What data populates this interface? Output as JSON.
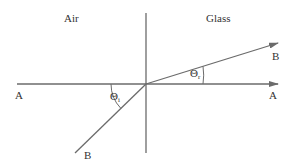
{
  "diagram": {
    "type": "refraction",
    "regions": {
      "left": "Air",
      "right": "Glass"
    },
    "points": {
      "A_left": "A",
      "A_right": "A",
      "B_incident": "B",
      "B_refracted": "B"
    },
    "angles": {
      "incident": {
        "symbol": "Θ",
        "subscript": "i"
      },
      "refracted": {
        "symbol": "Θ",
        "subscript": "r"
      }
    },
    "colors": {
      "line": "#6b6b6b",
      "text": "#333333",
      "background": "#ffffff"
    }
  }
}
